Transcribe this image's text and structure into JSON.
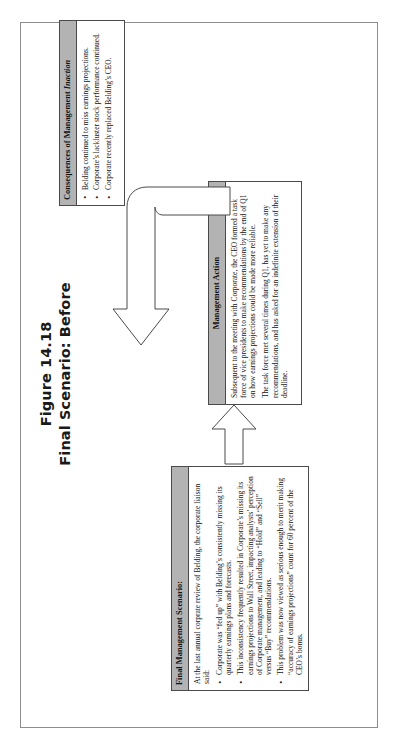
{
  "figure": {
    "number": "Figure 14.18",
    "caption": "Final Scenario: Before"
  },
  "boxes": {
    "scenario": {
      "header": "Final Management Scenario:",
      "intro": "At the last annual corprate review of Belding, the corporate liaison said:",
      "bullets": [
        "Corporate was “fed up” with Belding’s consistently missing its quarterly earnings plans and forecasts.",
        "This inconsistency frequently resulted in Corporate’s missing its earnings projections to Wall Street, impacting analysts’ perception of Corporate management, and leading to “Hold” and “Sell” versus “Buy” recommendations.",
        "This problem was now viewed as serious enough to merit making “accuracy of earnings projections” count for 60 percent of the CEO’s bonus."
      ]
    },
    "action": {
      "header": "Management Action",
      "paragraphs": [
        "Subsequent to the meeting with Corporate, the CEO formed a task force of vice presidents to make recommendations by the end of Q1 on how earnings projections could be made more reliable.",
        "The task force met several times during Q1, has yet to make any recommendations, and has asked for an indefinite extension of their deadline."
      ]
    },
    "consequences": {
      "header_prefix": "Consequences of Management ",
      "header_emphasis": "Inaction",
      "bullets": [
        "Belding continued to miss earnings projections.",
        "Corporate’s lackluster stock performance continued.",
        "Corporate recently replaced Belding’s CEO."
      ]
    }
  },
  "arrows": {
    "scenario_to_action": "block-arrow-right",
    "action_to_consequences": "curved-block-arrow-left"
  },
  "colors": {
    "header_fill": "#b3b3b3",
    "box_border": "#4a4a4a",
    "page_border": "#8d8d8d",
    "text": "#141414",
    "background": "#ffffff"
  }
}
